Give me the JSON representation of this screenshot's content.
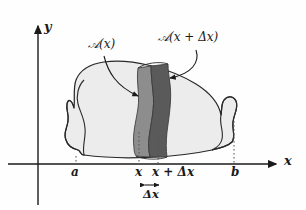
{
  "figure": {
    "domain": "diagram",
    "background_color": "#fefefe",
    "ink_color": "#1a1a1a"
  },
  "axes": {
    "y_label": "y",
    "x_label": "x",
    "x_axis_y": 164,
    "y_axis_x": 38,
    "y_axis_top": 22,
    "x_axis_right": 282
  },
  "tick_labels": [
    {
      "name": "a",
      "text": "a",
      "x": 72,
      "y": 170
    },
    {
      "name": "x",
      "text": "x",
      "x": 140,
      "y": 170
    },
    {
      "name": "x-plus-delta-x",
      "text": "x + Δx",
      "x": 157,
      "y": 170
    },
    {
      "name": "b",
      "text": "b",
      "x": 236,
      "y": 170
    }
  ],
  "area_labels": {
    "a_of_x": "𝒜(x)",
    "a_of_x_plain": "A(x)",
    "a_of_x_plus_dx": "𝒜(x + Δx)",
    "a_of_x_plus_dx_plain": "A(x + Δx)"
  },
  "delta_bracket": {
    "label": "Δx",
    "label_plain": "Delta x",
    "arrow_left_x": 141,
    "arrow_right_x": 163,
    "arrow_y": 185
  },
  "solid": {
    "fill_color": "#ececec",
    "outline_color": "#2a2a2a",
    "left_end_x": 72,
    "right_end_x": 236
  },
  "slices": {
    "a_of_x_band": {
      "label": "A(x)",
      "fill_color": "#8d8d8d",
      "x_position": 140
    },
    "a_of_x_plus_dx_band": {
      "label": "A(x + Δx)",
      "fill_color": "#5a5a5a",
      "x_position": 163
    }
  },
  "colors": {
    "body_fill": "#ececec",
    "band_light": "#8d8d8d",
    "band_dark": "#5a5a5a",
    "ink": "#1a1a1a",
    "dotted": "#555555"
  }
}
